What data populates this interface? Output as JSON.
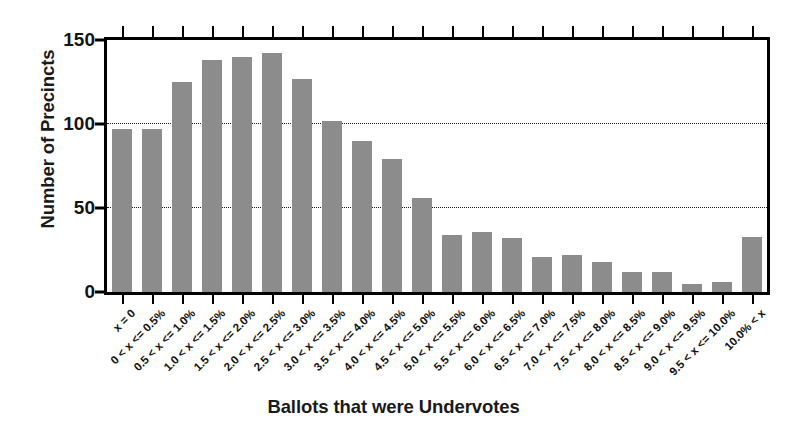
{
  "chart_data": {
    "type": "bar",
    "title": "",
    "xlabel": "Ballots that were Undervotes",
    "ylabel": "Number of Precincts",
    "ylim": [
      0,
      150
    ],
    "yticks": [
      0,
      50,
      100,
      150
    ],
    "ytick_labels": [
      "0",
      "50",
      "100",
      "150"
    ],
    "grid": "horizontal-dotted-at-50-and-100",
    "legend": "none",
    "bar_color": "#8c8c8c",
    "axis_color": "#000000",
    "categories": [
      "x = 0",
      "0 < x <= 0.5%",
      "0.5 < x <= 1.0%",
      "1.0 < x <= 1.5%",
      "1.5 < x <= 2.0%",
      "2.0 < x <= 2.5%",
      "2.5 < x <= 3.0%",
      "3.0 < x <= 3.5%",
      "3.5 < x <= 4.0%",
      "4.0 < x <= 4.5%",
      "4.5 < x <= 5.0%",
      "5.0 < x <= 5.5%",
      "5.5 < x <= 6.0%",
      "6.0 < x <= 6.5%",
      "6.5 < x <= 7.0%",
      "7.0 < x <= 7.5%",
      "7.5 < x <= 8.0%",
      "8.0 < x <= 8.5%",
      "8.5 < x <= 9.0%",
      "9.0 < x <= 9.5%",
      "9.5 < x <= 10.0%",
      "10.0% < x"
    ],
    "values": [
      97,
      97,
      125,
      138,
      140,
      142,
      127,
      102,
      90,
      79,
      56,
      34,
      36,
      32,
      21,
      22,
      18,
      12,
      12,
      5,
      6,
      33
    ]
  }
}
